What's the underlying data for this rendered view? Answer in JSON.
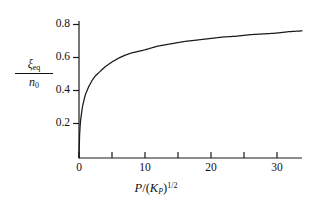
{
  "figure": {
    "background_color": "#ffffff",
    "line_color": "#1a1a1a",
    "axis_color": "#1a1a1a"
  },
  "axes": {
    "y_label_numerator": "ξ",
    "y_label_numerator_sub": "eq",
    "y_label_denominator": "n",
    "y_label_denominator_sub": "0",
    "x_label_p": "P",
    "x_label_slash": "/",
    "x_label_open": "(",
    "x_label_k": "K",
    "x_label_k_sub": "P",
    "x_label_close": ")",
    "x_label_exp": "1/2",
    "y_ticks": [
      "0.8",
      "0.6",
      "0.4",
      "0.2"
    ],
    "x_ticks": [
      "0",
      "10",
      "20",
      "30"
    ]
  },
  "chart_data": {
    "type": "line",
    "title": "",
    "xlabel": "P / (K_P)^(1/2)",
    "ylabel": "xi_eq / n_0",
    "xlim": [
      0,
      34
    ],
    "ylim": [
      0,
      0.9
    ],
    "grid": false,
    "legend": null,
    "x_major_ticks": [
      0,
      10,
      20,
      30
    ],
    "x_minor_ticks": [
      5,
      15,
      25
    ],
    "y_major_ticks": [
      0.2,
      0.4,
      0.6,
      0.8
    ],
    "series": [
      {
        "name": "equilibrium extent of reaction",
        "x": [
          0,
          0.1,
          0.25,
          0.5,
          0.75,
          1,
          1.5,
          2,
          2.5,
          3,
          4,
          5,
          6,
          7,
          8,
          9,
          10,
          12,
          14,
          16,
          18,
          20,
          22,
          24,
          26,
          28,
          30,
          32,
          34
        ],
        "values": [
          0,
          0.17,
          0.25,
          0.33,
          0.38,
          0.42,
          0.47,
          0.51,
          0.54,
          0.56,
          0.6,
          0.63,
          0.655,
          0.675,
          0.69,
          0.7,
          0.71,
          0.735,
          0.75,
          0.765,
          0.775,
          0.785,
          0.795,
          0.8,
          0.81,
          0.815,
          0.82,
          0.83,
          0.835
        ]
      }
    ],
    "annotations": []
  }
}
